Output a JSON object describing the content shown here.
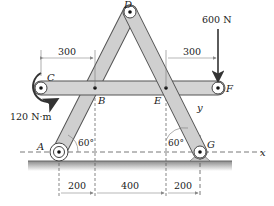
{
  "diagram": {
    "points": {
      "A": "A",
      "B": "B",
      "C": "C",
      "D": "D",
      "E": "E",
      "F": "F",
      "G": "G"
    },
    "axes": {
      "x": "x",
      "y": "y"
    },
    "loads": {
      "force": "600 N",
      "moment": "120 N·m"
    },
    "angles": {
      "left": "60°",
      "right": "60°"
    },
    "dimensions": {
      "top_left": "300",
      "top_right": "300",
      "bottom_1": "200",
      "bottom_2": "400",
      "bottom_3": "200"
    },
    "colors": {
      "member_fill": "#cfcfcf",
      "member_stroke": "#555555",
      "ground": "#9a9a9a",
      "line": "#333333"
    }
  }
}
